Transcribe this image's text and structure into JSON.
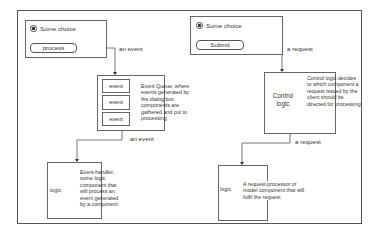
{
  "left_flow": {
    "form": {
      "radio_label": "Some choice",
      "button_label": "process"
    },
    "arrow1_label": "an event",
    "queue": {
      "cells": [
        "event",
        "event",
        "event"
      ],
      "description": "Event Queue, where events generated by the dialog box components are gathered and put to processing"
    },
    "arrow2_label": "an event",
    "handler": {
      "label": "logic",
      "description": "Event-handler, some logic component that will process an event generated by a component"
    }
  },
  "right_flow": {
    "form": {
      "radio_label": "Some choice",
      "button_label": "Submit"
    },
    "arrow1_label": "a request",
    "control": {
      "label": "Control logic",
      "description": "Control logic decides to which component a request issued by the client should be directed for processing"
    },
    "arrow2_label": "a request",
    "processor": {
      "label": "logic",
      "description": "A request-processor or model component that will fulfil the request"
    }
  },
  "colors": {
    "line": "#555555",
    "text": "#333333",
    "background": "#ffffff"
  }
}
